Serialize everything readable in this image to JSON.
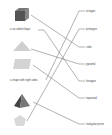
{
  "left_items": [
    {
      "type": "image",
      "shape": "cube",
      "icon": "cube-icon"
    },
    {
      "type": "text",
      "label": "a six-sided shape"
    },
    {
      "type": "image",
      "shape": "triangle",
      "icon": "triangle-icon"
    },
    {
      "type": "image",
      "shape": "parallelogram",
      "icon": "parallelogram-icon"
    },
    {
      "type": "text",
      "label": "a shape with eight sides"
    },
    {
      "type": "image",
      "shape": "pyramid",
      "icon": "pyramid-icon"
    },
    {
      "type": "image",
      "shape": "pentagon",
      "icon": "pentagon-icon"
    }
  ],
  "right_labels": [
    "octagon",
    "pentagon",
    "cube",
    "pyramid",
    "hexagon",
    "trapezoid",
    "triangular prism"
  ],
  "connections": [
    {
      "from": "cube",
      "to": "cube"
    },
    {
      "from": "a six-sided shape",
      "to": "hexagon"
    },
    {
      "from": "triangle",
      "to": "pyramid"
    },
    {
      "from": "parallelogram",
      "to": "trapezoid"
    },
    {
      "from": "a shape with eight sides",
      "to": "octagon"
    },
    {
      "from": "pyramid",
      "to": "triangular prism"
    },
    {
      "from": "pentagon",
      "to": "pentagon"
    }
  ],
  "colors": {
    "line": "#555555",
    "shape_light": "#cfcfcf",
    "shape_dark": "#555555",
    "text": "#444444"
  }
}
